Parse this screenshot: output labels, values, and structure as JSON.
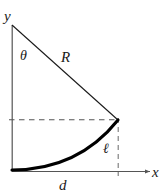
{
  "figure": {
    "type": "geometry-diagram",
    "background_color": "#ffffff",
    "stroke_color": "#1a1a1a",
    "curve_color": "#000000",
    "dashed_color": "#555555",
    "axis_color": "#555555"
  },
  "axes": {
    "y_label": "y",
    "x_label": "x"
  },
  "labels": {
    "angle": "θ",
    "radius": "R",
    "arc": "ℓ",
    "base": "d"
  },
  "geometry": {
    "apex": {
      "x": 12,
      "y": 25
    },
    "right_vertex": {
      "x": 118,
      "y": 120
    },
    "origin": {
      "x": 12,
      "y": 171
    },
    "x_axis_end": {
      "x": 150,
      "y": 171
    },
    "y_axis_top": {
      "x": 12,
      "y": 25
    },
    "curve_control": {
      "x": 75,
      "y": 168
    },
    "dashed_horizontal": {
      "x1": 12,
      "y1": 120,
      "x2": 118,
      "y2": 120
    },
    "dashed_vertical": {
      "x1": 118,
      "y1": 120,
      "x2": 118,
      "y2": 171
    }
  },
  "label_positions": {
    "y": {
      "x": 4,
      "y": 21
    },
    "x": {
      "x": 152,
      "y": 177
    },
    "theta": {
      "x": 20,
      "y": 60
    },
    "radius": {
      "x": 61,
      "y": 62
    },
    "arc": {
      "x": 103,
      "y": 153
    },
    "base": {
      "x": 59,
      "y": 190
    }
  }
}
